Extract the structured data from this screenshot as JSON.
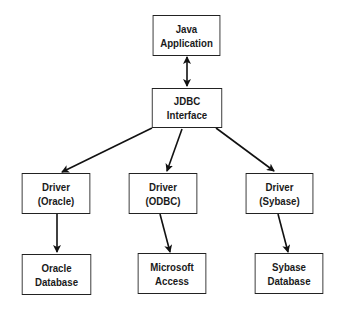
{
  "diagram": {
    "nodes": {
      "java_app": {
        "line1": "Java",
        "line2": "Application"
      },
      "jdbc": {
        "line1": "JDBC Interface"
      },
      "driver_oracle": {
        "line1": "Driver",
        "line2": "(Oracle)"
      },
      "driver_odbc": {
        "line1": "Driver",
        "line2": "(ODBC)"
      },
      "driver_sybase": {
        "line1": "Driver",
        "line2": "(Sybase)"
      },
      "oracle_db": {
        "line1": "Oracle",
        "line2": "Database"
      },
      "ms_access": {
        "line1": "Microsoft",
        "line2": "Access"
      },
      "sybase_db": {
        "line1": "Sybase",
        "line2": "Database"
      }
    },
    "edges": [
      {
        "from": "java_app",
        "to": "jdbc",
        "type": "bidirectional"
      },
      {
        "from": "jdbc",
        "to": "driver_oracle",
        "type": "directed"
      },
      {
        "from": "jdbc",
        "to": "driver_odbc",
        "type": "directed"
      },
      {
        "from": "jdbc",
        "to": "driver_sybase",
        "type": "directed"
      },
      {
        "from": "driver_oracle",
        "to": "oracle_db",
        "type": "directed"
      },
      {
        "from": "driver_odbc",
        "to": "ms_access",
        "type": "directed"
      },
      {
        "from": "driver_sybase",
        "to": "sybase_db",
        "type": "directed"
      }
    ]
  }
}
